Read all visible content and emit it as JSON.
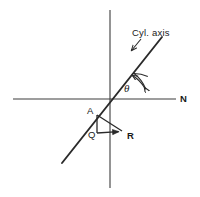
{
  "figure": {
    "background_color": "#ffffff",
    "line_color": "#2a2a2a",
    "axis_color": "#3c3c3c",
    "width": 200,
    "height": 197,
    "labels": {
      "cyl_axis": "Cyl. axis",
      "theta": "θ",
      "north": "N",
      "point_a": "A",
      "point_q": "Q",
      "point_r": "R"
    },
    "label_positions": {
      "cyl_axis": {
        "x": 132,
        "y": 36
      },
      "theta": {
        "x": 124,
        "y": 92
      },
      "north": {
        "x": 180,
        "y": 102
      },
      "point_a": {
        "x": 87,
        "y": 114
      },
      "point_q": {
        "x": 88,
        "y": 138
      },
      "point_r": {
        "x": 127,
        "y": 139
      }
    },
    "geometry": {
      "origin": {
        "x": 110,
        "y": 99
      },
      "horizontal_axis": {
        "x1": 13,
        "y1": 99,
        "x2": 176,
        "y2": 99
      },
      "vertical_axis": {
        "x1": 110,
        "y1": 10,
        "x2": 110,
        "y2": 188
      },
      "cyl_axis_line": {
        "x1": 62,
        "y1": 163,
        "x2": 162,
        "y2": 37
      },
      "cyl_axis_leader": {
        "x1": 140,
        "y1": 39,
        "x2": 130,
        "y2": 51
      },
      "angle_arc": {
        "center": {
          "x": 110,
          "y": 99
        },
        "radius": 38,
        "start_angle_deg": 0,
        "end_angle_deg": 52,
        "double_headed": true
      },
      "triangle": {
        "a": {
          "x": 97,
          "y": 115
        },
        "q": {
          "x": 97,
          "y": 133
        },
        "r": {
          "x": 122,
          "y": 131
        },
        "vector_arrow_at": "r"
      }
    }
  }
}
